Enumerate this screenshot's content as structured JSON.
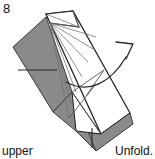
{
  "figure": {
    "step_number": "8",
    "caption_left": "upper",
    "caption_right": "Unfold.",
    "colors": {
      "shaded_paper": "#8a8a8a",
      "white_paper": "#ffffff",
      "outline": "#1a1a1a",
      "crease_line": "#6e6e6e",
      "arrow": "#2a2a2a",
      "background": "#ffffff"
    },
    "icons": {
      "unfold_arrow": "curved-arrow-icon"
    }
  }
}
